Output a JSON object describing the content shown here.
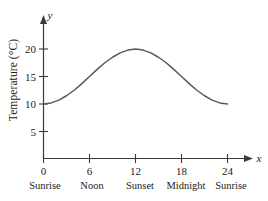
{
  "chart_data": {
    "type": "line",
    "title": "",
    "xlabel": "x",
    "ylabel": "Temperature (°C)",
    "yaxis_symbol": "y",
    "xaxis_symbol": "x",
    "xlim": [
      0,
      26
    ],
    "ylim": [
      0,
      22
    ],
    "grid": false,
    "legend": null,
    "curve_color": "#595959",
    "axis_color": "#3b3b3b",
    "x_ticks": [
      0,
      6,
      12,
      18,
      24
    ],
    "x_tick_labels": [
      "0",
      "6",
      "12",
      "18",
      "24"
    ],
    "x_category_labels": [
      "Sunrise",
      "Noon",
      "Sunset",
      "Midnight",
      "Sunrise"
    ],
    "y_ticks": [
      5,
      10,
      15,
      20
    ],
    "y_tick_labels": [
      "5",
      "10",
      "15",
      "20"
    ],
    "series": [
      {
        "name": "Temperature",
        "x": [
          0,
          1,
          2,
          3,
          4,
          5,
          6,
          7,
          8,
          9,
          10,
          11,
          12,
          13,
          14,
          15,
          16,
          17,
          18,
          19,
          20,
          21,
          22,
          23,
          24
        ],
        "values": [
          10.0,
          10.2,
          10.7,
          11.5,
          12.5,
          13.7,
          15.0,
          16.3,
          17.5,
          18.5,
          19.3,
          19.8,
          20.0,
          19.8,
          19.3,
          18.5,
          17.5,
          16.3,
          15.0,
          13.7,
          12.5,
          11.5,
          10.7,
          10.2,
          10.0
        ]
      }
    ],
    "annotations": {
      "minimum_value": 10,
      "maximum_value": 20,
      "peak_at_x": 12,
      "formula_description": "y = 15 - 5 cos(pi x / 12)"
    }
  },
  "axis_labels": {
    "y_symbol": "y",
    "x_symbol": "x",
    "y_title": "Temperature (°C)"
  },
  "ticks": {
    "y": [
      {
        "label": "20"
      },
      {
        "label": "15"
      },
      {
        "label": "10"
      },
      {
        "label": "5"
      }
    ],
    "x": [
      {
        "label": "0",
        "category": "Sunrise"
      },
      {
        "label": "6",
        "category": "Noon"
      },
      {
        "label": "12",
        "category": "Sunset"
      },
      {
        "label": "18",
        "category": "Midnight"
      },
      {
        "label": "24",
        "category": "Sunrise"
      }
    ]
  }
}
